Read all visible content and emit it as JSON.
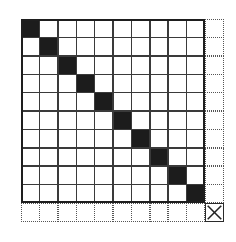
{
  "diagram": {
    "rows": 11,
    "cols": 11,
    "inner_block_size": 10,
    "filled_cells": [
      [
        0,
        0
      ],
      [
        1,
        1
      ],
      [
        2,
        2
      ],
      [
        3,
        3
      ],
      [
        4,
        4
      ],
      [
        5,
        5
      ],
      [
        6,
        6
      ],
      [
        7,
        7
      ],
      [
        8,
        8
      ],
      [
        9,
        9
      ]
    ],
    "x_marked_cells": [
      [
        10,
        10
      ]
    ],
    "colors": {
      "fill": "#1c1c1c",
      "grid_line": "#3a3a3a",
      "background": "#ffffff"
    }
  }
}
